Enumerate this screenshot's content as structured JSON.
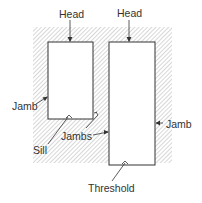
{
  "diagram": {
    "labels": {
      "head_left": "Head",
      "head_right": "Head",
      "jamb_left": "Jamb",
      "jamb_right": "Jamb",
      "jambs": "Jambs",
      "sill": "Sill",
      "threshold": "Threshold"
    },
    "elements": [
      {
        "name": "wall",
        "fill": "hatched"
      },
      {
        "name": "window-opening",
        "parts": [
          "Head",
          "Jamb",
          "Sill"
        ]
      },
      {
        "name": "door-opening",
        "parts": [
          "Head",
          "Jamb",
          "Threshold"
        ]
      }
    ],
    "colors": {
      "stroke": "#333333",
      "hatch": "#9a9a9a",
      "text": "#333333"
    }
  }
}
